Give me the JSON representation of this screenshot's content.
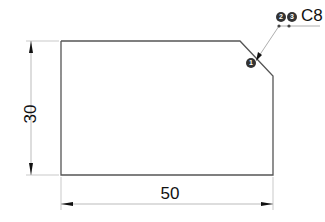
{
  "drawing": {
    "shape": "rectangle with chamfered top-right corner",
    "dimensions": {
      "height": "30",
      "width": "50"
    },
    "callout": {
      "label": "C8",
      "markers": [
        "1",
        "2",
        "3"
      ]
    },
    "colors": {
      "outline": "#555555",
      "dimension_line": "#aaaaaa",
      "badge": "#333333"
    }
  }
}
